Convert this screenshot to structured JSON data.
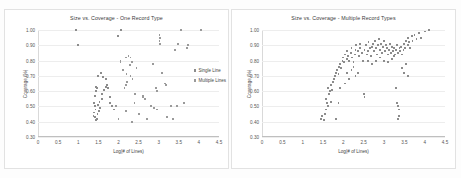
{
  "figure": {
    "background": "#ffffff",
    "marker_color": "#8c8c8c",
    "gridline_color": "#ededed"
  },
  "chart_data": [
    {
      "type": "scatter",
      "panel": "left",
      "title": "Size vs. Coverage - One Record Type",
      "xlabel": "Log(# of Lines)",
      "ylabel": "Coverage (%)",
      "xlim": [
        0,
        4.5
      ],
      "ylim": [
        0.3,
        1.0
      ],
      "xticks": [
        "0",
        "0.5",
        "1",
        "1.5",
        "2",
        "2.5",
        "3",
        "3.5",
        "4",
        "4.5"
      ],
      "xtick_values": [
        0,
        0.5,
        1,
        1.5,
        2,
        2.5,
        3,
        3.5,
        4,
        4.5
      ],
      "yticks": [
        "0.30",
        "0.40",
        "0.50",
        "0.60",
        "0.70",
        "0.80",
        "0.90",
        "1.00"
      ],
      "ytick_values": [
        0.3,
        0.4,
        0.5,
        0.6,
        0.7,
        0.8,
        0.9,
        1.0
      ],
      "grid": "horizontal",
      "legend_position": "right",
      "series": [
        {
          "name": "Single Line",
          "points": [
            [
              0.95,
              1.0
            ],
            [
              1.0,
              0.9
            ],
            [
              2.07,
              1.0
            ],
            [
              1.98,
              0.96
            ],
            [
              1.5,
              0.7
            ],
            [
              1.57,
              0.72
            ],
            [
              1.62,
              0.69
            ],
            [
              1.7,
              0.68
            ],
            [
              1.42,
              0.57
            ],
            [
              1.45,
              0.6
            ],
            [
              1.47,
              0.62
            ],
            [
              1.44,
              0.63
            ],
            [
              1.4,
              0.52
            ],
            [
              1.41,
              0.5
            ],
            [
              1.43,
              0.48
            ],
            [
              1.39,
              0.46
            ],
            [
              1.38,
              0.44
            ],
            [
              1.42,
              0.43
            ],
            [
              1.46,
              0.42
            ],
            [
              1.44,
              0.41
            ],
            [
              1.48,
              0.45
            ],
            [
              1.52,
              0.47
            ],
            [
              1.55,
              0.49
            ],
            [
              1.5,
              0.51
            ],
            [
              1.53,
              0.53
            ],
            [
              1.58,
              0.55
            ],
            [
              1.6,
              0.58
            ],
            [
              1.64,
              0.61
            ],
            [
              1.68,
              0.63
            ],
            [
              1.72,
              0.64
            ],
            [
              1.75,
              0.62
            ],
            [
              1.78,
              0.56
            ],
            [
              1.8,
              0.52
            ],
            [
              1.85,
              0.5
            ],
            [
              1.88,
              0.48
            ]
          ]
        },
        {
          "name": "Multiple Lines",
          "points": [
            [
              3.02,
              0.97
            ],
            [
              3.03,
              0.95
            ],
            [
              3.02,
              0.93
            ],
            [
              3.03,
              0.91
            ],
            [
              3.55,
              1.0
            ],
            [
              3.48,
              0.91
            ],
            [
              3.4,
              0.87
            ],
            [
              2.05,
              0.8
            ],
            [
              2.05,
              0.79
            ],
            [
              2.18,
              0.82
            ],
            [
              2.25,
              0.83
            ],
            [
              2.3,
              0.82
            ],
            [
              2.33,
              0.79
            ],
            [
              2.28,
              0.77
            ],
            [
              2.12,
              0.74
            ],
            [
              2.2,
              0.71
            ],
            [
              2.22,
              0.66
            ],
            [
              2.19,
              0.64
            ],
            [
              2.15,
              0.62
            ],
            [
              2.3,
              0.7
            ],
            [
              2.35,
              0.68
            ],
            [
              2.45,
              0.75
            ],
            [
              2.42,
              0.58
            ],
            [
              2.4,
              0.52
            ],
            [
              2.33,
              0.4
            ],
            [
              2.18,
              0.47
            ],
            [
              2.6,
              0.57
            ],
            [
              2.62,
              0.56
            ],
            [
              2.65,
              0.55
            ],
            [
              2.72,
              0.42
            ],
            [
              2.8,
              0.5
            ],
            [
              2.88,
              0.49
            ],
            [
              2.95,
              0.48
            ],
            [
              2.93,
              0.62
            ],
            [
              2.96,
              0.6
            ],
            [
              2.85,
              0.78
            ],
            [
              3.08,
              0.72
            ],
            [
              3.15,
              0.65
            ],
            [
              3.18,
              0.64
            ],
            [
              3.2,
              0.43
            ],
            [
              3.3,
              0.5
            ],
            [
              3.35,
              0.42
            ],
            [
              3.45,
              0.5
            ],
            [
              3.62,
              0.52
            ],
            [
              3.7,
              0.88
            ],
            [
              3.72,
              0.9
            ],
            [
              4.05,
              1.0
            ],
            [
              2.5,
              0.45
            ],
            [
              1.95,
              0.5
            ],
            [
              2.0,
              0.42
            ]
          ]
        }
      ]
    },
    {
      "type": "scatter",
      "panel": "right",
      "title": "Size vs. Coverage - Multiple Record Types",
      "xlabel": "Log(# of Lines)",
      "ylabel": "Coverage (%)",
      "xlim": [
        0,
        4.5
      ],
      "ylim": [
        0.3,
        1.0
      ],
      "xticks": [
        "0",
        "0.5",
        "1",
        "1.5",
        "2",
        "2.5",
        "3",
        "3.5",
        "4",
        "4.5"
      ],
      "xtick_values": [
        0,
        0.5,
        1,
        1.5,
        2,
        2.5,
        3,
        3.5,
        4,
        4.5
      ],
      "yticks": [
        "0.30",
        "0.40",
        "0.50",
        "0.60",
        "0.70",
        "0.80",
        "0.90",
        "1.00"
      ],
      "ytick_values": [
        0.3,
        0.4,
        0.5,
        0.6,
        0.7,
        0.8,
        0.9,
        1.0
      ],
      "grid": "horizontal",
      "legend_position": "none",
      "series": [
        {
          "name": "Records",
          "points": [
            [
              1.45,
              0.42
            ],
            [
              1.48,
              0.44
            ],
            [
              1.52,
              0.41
            ],
            [
              1.55,
              0.45
            ],
            [
              1.58,
              0.48
            ],
            [
              1.6,
              0.52
            ],
            [
              1.57,
              0.55
            ],
            [
              1.62,
              0.5
            ],
            [
              1.65,
              0.58
            ],
            [
              1.68,
              0.6
            ],
            [
              1.63,
              0.62
            ],
            [
              1.7,
              0.64
            ],
            [
              1.72,
              0.61
            ],
            [
              1.75,
              0.66
            ],
            [
              1.78,
              0.68
            ],
            [
              1.8,
              0.7
            ],
            [
              1.82,
              0.72
            ],
            [
              1.85,
              0.74
            ],
            [
              1.88,
              0.71
            ],
            [
              1.9,
              0.76
            ],
            [
              1.92,
              0.78
            ],
            [
              1.95,
              0.75
            ],
            [
              1.98,
              0.8
            ],
            [
              2.0,
              0.82
            ],
            [
              2.02,
              0.79
            ],
            [
              2.05,
              0.84
            ],
            [
              2.08,
              0.81
            ],
            [
              2.1,
              0.86
            ],
            [
              2.12,
              0.83
            ],
            [
              2.15,
              0.8
            ],
            [
              2.18,
              0.85
            ],
            [
              2.2,
              0.88
            ],
            [
              2.22,
              0.82
            ],
            [
              2.25,
              0.79
            ],
            [
              2.28,
              0.84
            ],
            [
              2.3,
              0.87
            ],
            [
              2.32,
              0.9
            ],
            [
              2.35,
              0.86
            ],
            [
              2.38,
              0.83
            ],
            [
              2.4,
              0.88
            ],
            [
              2.42,
              0.91
            ],
            [
              2.45,
              0.85
            ],
            [
              2.48,
              0.8
            ],
            [
              2.5,
              0.58
            ],
            [
              2.52,
              0.87
            ],
            [
              2.55,
              0.9
            ],
            [
              2.58,
              0.84
            ],
            [
              2.6,
              0.86
            ],
            [
              2.62,
              0.92
            ],
            [
              2.65,
              0.88
            ],
            [
              2.68,
              0.83
            ],
            [
              2.7,
              0.89
            ],
            [
              2.72,
              0.91
            ],
            [
              2.75,
              0.86
            ],
            [
              2.78,
              0.93
            ],
            [
              2.8,
              0.88
            ],
            [
              2.82,
              0.84
            ],
            [
              2.85,
              0.9
            ],
            [
              2.88,
              0.94
            ],
            [
              2.9,
              0.87
            ],
            [
              2.92,
              0.91
            ],
            [
              2.95,
              0.85
            ],
            [
              2.98,
              0.89
            ],
            [
              3.0,
              0.93
            ],
            [
              3.02,
              0.86
            ],
            [
              3.05,
              0.9
            ],
            [
              3.08,
              0.88
            ],
            [
              3.1,
              0.84
            ],
            [
              3.12,
              0.87
            ],
            [
              3.15,
              0.91
            ],
            [
              3.18,
              0.85
            ],
            [
              3.2,
              0.89
            ],
            [
              3.22,
              0.86
            ],
            [
              3.25,
              0.88
            ],
            [
              3.28,
              0.84
            ],
            [
              3.3,
              0.87
            ],
            [
              3.32,
              0.9
            ],
            [
              3.35,
              0.85
            ],
            [
              3.38,
              0.88
            ],
            [
              3.4,
              0.86
            ],
            [
              3.42,
              0.89
            ],
            [
              3.45,
              0.84
            ],
            [
              3.48,
              0.87
            ],
            [
              3.5,
              0.91
            ],
            [
              3.52,
              0.88
            ],
            [
              3.55,
              0.93
            ],
            [
              3.58,
              0.9
            ],
            [
              3.6,
              0.95
            ],
            [
              3.62,
              0.92
            ],
            [
              3.65,
              0.88
            ],
            [
              3.68,
              0.96
            ],
            [
              3.7,
              0.93
            ],
            [
              3.75,
              0.97
            ],
            [
              3.8,
              0.94
            ],
            [
              3.85,
              0.98
            ],
            [
              3.9,
              0.95
            ],
            [
              4.0,
              0.99
            ],
            [
              4.1,
              1.0
            ],
            [
              3.35,
              0.5
            ],
            [
              3.33,
              0.52
            ],
            [
              3.36,
              0.48
            ],
            [
              3.34,
              0.42
            ],
            [
              3.37,
              0.44
            ],
            [
              3.3,
              0.62
            ],
            [
              3.45,
              0.75
            ],
            [
              3.5,
              0.72
            ],
            [
              3.55,
              0.78
            ],
            [
              3.6,
              0.7
            ],
            [
              2.52,
              0.56
            ],
            [
              2.3,
              0.7
            ],
            [
              2.35,
              0.72
            ],
            [
              1.7,
              0.53
            ],
            [
              1.82,
              0.42
            ],
            [
              1.88,
              0.52
            ],
            [
              1.92,
              0.62
            ],
            [
              2.05,
              0.65
            ],
            [
              2.1,
              0.72
            ],
            [
              2.15,
              0.68
            ],
            [
              2.2,
              0.74
            ],
            [
              2.25,
              0.76
            ],
            [
              2.6,
              0.8
            ],
            [
              2.7,
              0.78
            ],
            [
              2.8,
              0.8
            ],
            [
              2.9,
              0.82
            ],
            [
              3.0,
              0.8
            ],
            [
              3.1,
              0.79
            ],
            [
              3.2,
              0.81
            ],
            [
              3.25,
              0.83
            ]
          ]
        }
      ]
    }
  ]
}
